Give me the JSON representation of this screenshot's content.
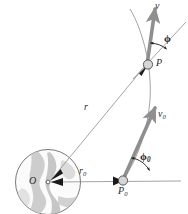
{
  "figure": {
    "background_color": "#ffffff",
    "width": 188,
    "height": 214,
    "colors": {
      "outline": "#555555",
      "thin_line": "#8d8d8d",
      "vector_gray": "#8f8f8f",
      "arrow_dark": "#1a1a1a",
      "globe_fill": "#fbfbfb",
      "globe_land": "#c9c9c9",
      "globe_land_dark": "#b0b0b0",
      "label_text": "#2b2b2b",
      "marker_fill": "#d6d6d6"
    },
    "labels": {
      "velocity": "v",
      "velocity_initial_base": "v",
      "velocity_initial_sub": "0",
      "angle_phi": "ϕ",
      "angle_phi0_base": "ϕ",
      "angle_phi0_sub": "0",
      "point_P": "P",
      "point_P0_base": "P",
      "point_P0_sub": "0",
      "radius_r": "r",
      "radius_r0_base": "r",
      "radius_r0_sub": "0",
      "origin_O": "O"
    },
    "elements": {
      "globe_name": "earth-globe",
      "trajectory_name": "trajectory-curve",
      "radial_line_r_name": "radial-line-r",
      "radial_line_r0_name": "radial-line-r0",
      "velocity_vector_name": "velocity-vector-v",
      "velocity_vector_initial_name": "velocity-vector-v0",
      "angle_arc_name": "angle-arc-phi",
      "angle_arc_initial_name": "angle-arc-phi0",
      "marker_P_name": "point-marker-P",
      "marker_P0_name": "point-marker-P0"
    }
  }
}
